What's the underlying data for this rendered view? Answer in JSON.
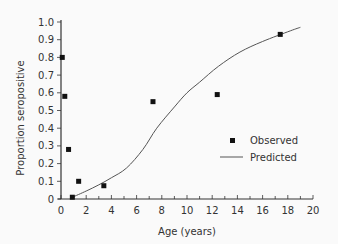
{
  "chart_data": {
    "type": "scatter",
    "title": "",
    "xlabel": "Age (years)",
    "ylabel": "Proportion seropositive",
    "xlim": [
      0,
      20
    ],
    "ylim": [
      0,
      1.0
    ],
    "grid": false,
    "legend_position": "lower right (inside)",
    "x_ticks": [
      "0",
      "2",
      "4",
      "6",
      "8",
      "10",
      "12",
      "14",
      "16",
      "18",
      "20"
    ],
    "y_ticks": [
      "0",
      "0.1",
      "0.2",
      "0.3",
      "0.4",
      "0.5",
      "0.6",
      "0.7",
      "0.8",
      "0.9",
      "1.0"
    ],
    "series": [
      {
        "name": "Observed",
        "type": "scatter",
        "marker": "square",
        "x": [
          0.1,
          0.3,
          0.6,
          0.9,
          1.4,
          3.4,
          7.3,
          12.4,
          17.4
        ],
        "y": [
          0.8,
          0.58,
          0.28,
          0.01,
          0.1,
          0.075,
          0.55,
          0.59,
          0.93
        ]
      },
      {
        "name": "Predicted",
        "type": "line",
        "x": [
          0.9,
          2.0,
          3.0,
          4.0,
          5.2,
          6.5,
          7.6,
          9.0,
          10.0,
          11.0,
          12.5,
          14.2,
          16.0,
          18.2,
          19.0
        ],
        "y": [
          0.01,
          0.045,
          0.08,
          0.12,
          0.175,
          0.28,
          0.4,
          0.52,
          0.6,
          0.66,
          0.75,
          0.83,
          0.89,
          0.95,
          0.97
        ]
      }
    ]
  },
  "legend": {
    "observed_label": "Observed",
    "predicted_label": "Predicted"
  },
  "axes": {
    "x_title": "Age (years)",
    "y_title": "Proportion seropositive"
  }
}
